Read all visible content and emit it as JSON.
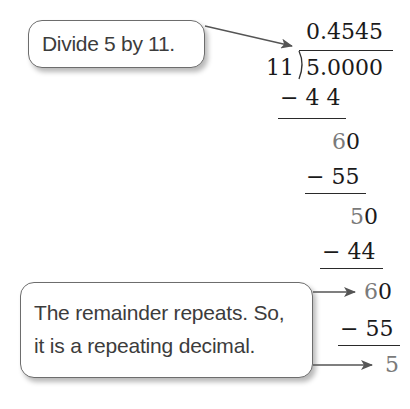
{
  "callouts": {
    "divide": "Divide 5 by 11.",
    "repeat_line1": "The remainder repeats. So,",
    "repeat_line2": "it is a repeating decimal."
  },
  "long_division": {
    "quotient": "0.4545",
    "divisor": "11",
    "dividend": "5.0000",
    "steps": [
      {
        "subtract": "− 4 4"
      },
      {
        "remainder_digit": "6",
        "brought_down": "0",
        "subtract": "− 55"
      },
      {
        "remainder_digit": "5",
        "brought_down": "0",
        "subtract": "− 44"
      },
      {
        "remainder_digit": "6",
        "brought_down": "0",
        "subtract": "− 55"
      },
      {
        "final_remainder": "5"
      }
    ]
  },
  "colors": {
    "text": "#1a1a1a",
    "remainder_grey": "#7a7a7a",
    "callout_border": "#6d6d6d",
    "callout_text": "#3c3c3c"
  }
}
